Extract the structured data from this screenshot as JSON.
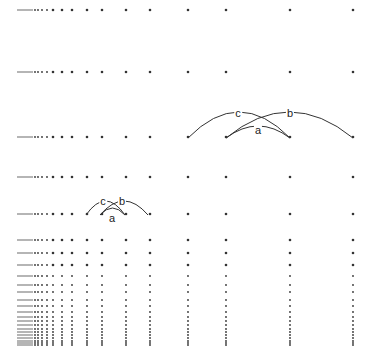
{
  "diagram": {
    "type": "reciprocal-lattice-arcs",
    "columns_x": [
      18,
      20,
      22,
      24,
      26,
      28,
      30,
      32,
      35,
      38,
      42,
      47,
      53,
      62,
      72,
      87,
      102,
      126,
      150,
      188,
      226,
      290,
      353
    ],
    "rows_y": [
      10,
      72,
      137,
      177,
      214,
      240,
      253,
      265,
      276,
      285,
      292,
      300,
      306,
      312,
      317,
      321,
      325,
      329,
      332,
      335,
      338,
      341,
      343,
      345
    ],
    "dot_color": "#333333",
    "arc_color": "#333333",
    "arc_groups": [
      {
        "name": "upper-group",
        "arcs": [
          {
            "label": "c",
            "x1": 188,
            "x2": 290,
            "y": 138,
            "h": 26,
            "lx": 238,
            "ly": 113
          },
          {
            "label": "b",
            "x1": 226,
            "x2": 353,
            "y": 138,
            "h": 26,
            "lx": 290,
            "ly": 113
          },
          {
            "label": "a",
            "x1": 226,
            "x2": 290,
            "y": 138,
            "h": 12,
            "lx": 258,
            "ly": 130
          }
        ]
      },
      {
        "name": "lower-group",
        "arcs": [
          {
            "label": "c",
            "x1": 86,
            "x2": 125,
            "y": 215,
            "h": 14,
            "lx": 103,
            "ly": 201
          },
          {
            "label": "b",
            "x1": 100,
            "x2": 148,
            "y": 215,
            "h": 14,
            "lx": 122,
            "ly": 201
          },
          {
            "label": "a",
            "x1": 100,
            "x2": 125,
            "y": 215,
            "h": 7,
            "lx": 112,
            "ly": 218
          }
        ]
      }
    ]
  }
}
